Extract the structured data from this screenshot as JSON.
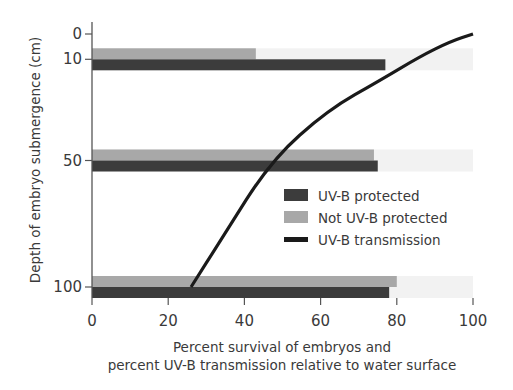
{
  "chart_data": {
    "type": "bar",
    "orientation": "horizontal",
    "title": "",
    "xlabel_line1": "Percent survival of embryos and",
    "xlabel_line2": "percent UV-B transmission relative to water surface",
    "ylabel": "Depth of embryo submergence (cm)",
    "xlim": [
      0,
      100
    ],
    "ylim": [
      0,
      100
    ],
    "y_inverted": true,
    "x_ticks": [
      0,
      20,
      40,
      60,
      80,
      100
    ],
    "y_ticks": [
      0,
      10,
      50,
      100
    ],
    "categories": [
      10,
      50,
      100
    ],
    "series": [
      {
        "name": "UV-B protected",
        "type": "bar",
        "color": "#3c3c3c",
        "values": [
          77,
          75,
          78
        ]
      },
      {
        "name": "Not UV-B protected",
        "type": "bar",
        "color": "#a8a8a8",
        "values": [
          43,
          74,
          80
        ]
      },
      {
        "name": "UV-B transmission",
        "type": "line",
        "color": "#1a1a1a",
        "points": [
          [
            26,
            100
          ],
          [
            34,
            81
          ],
          [
            47,
            50
          ],
          [
            62,
            30
          ],
          [
            76,
            18
          ],
          [
            86,
            9
          ],
          [
            94,
            3
          ],
          [
            100,
            0
          ]
        ]
      }
    ],
    "legend": {
      "position": "inside-right",
      "entries": [
        "UV-B protected",
        "Not UV-B protected",
        "UV-B transmission"
      ]
    },
    "grid": false
  }
}
